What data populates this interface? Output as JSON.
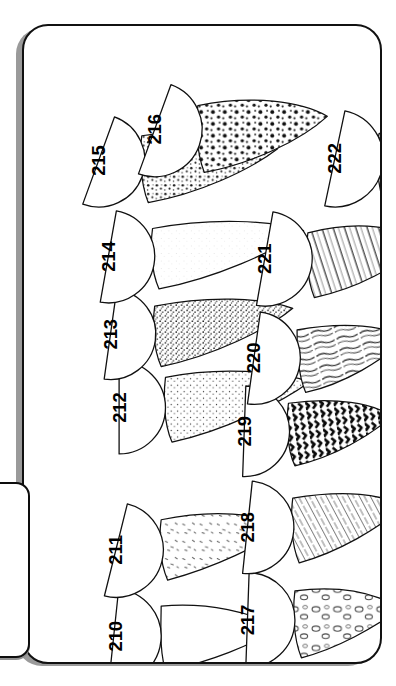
{
  "plate": {
    "tab_label": "Planche 15A",
    "title": "Planche 15A",
    "kind": "mycological identification plate",
    "orientation": "rotated-90",
    "background_color": "#ffffff",
    "ink_color": "#111111",
    "frame_shadow_color": "#9a9a9a"
  },
  "figures": [
    {
      "id": "fig-210",
      "number": "210",
      "cap_texture": "smooth",
      "stem_texture": "smooth",
      "cap": {
        "cx": 98,
        "cy": 588,
        "r": 44,
        "rot": 96
      },
      "num": {
        "x": 100,
        "y": 588
      },
      "stem": "M 142 560 C 186 556 226 566 252 580 C 226 596 188 612 146 620 C 140 600 142 576 142 560 Z"
    },
    {
      "id": "fig-211",
      "number": "211",
      "cap_texture": "smooth",
      "stem_texture": "sparse-flecks",
      "cap": {
        "cx": 100,
        "cy": 508,
        "r": 44,
        "rot": 104
      },
      "num": {
        "x": 100,
        "y": 508
      },
      "stem": "M 142 480 C 190 470 232 474 258 486 C 234 504 192 524 148 536 C 140 518 140 494 142 480 Z"
    },
    {
      "id": "fig-212",
      "number": "212",
      "cap_texture": "smooth",
      "stem_texture": "fine-stipple",
      "cap": {
        "cx": 103,
        "cy": 376,
        "r": 43,
        "rot": 90
      },
      "num": {
        "x": 103,
        "y": 376
      },
      "stem": "M 146 348 C 196 338 248 342 280 352 C 252 372 200 398 152 408 C 144 390 144 364 146 348 Z"
    },
    {
      "id": "fig-213",
      "number": "213",
      "cap_texture": "smooth",
      "stem_texture": "dense-stipple",
      "cap": {
        "cx": 95,
        "cy": 308,
        "r": 42,
        "rot": 98
      },
      "num": {
        "x": 95,
        "y": 308
      },
      "stem": "M 136 282 C 186 272 236 274 264 284 C 240 304 190 328 142 338 C 134 320 134 296 136 282 Z"
    },
    {
      "id": "fig-214",
      "number": "214",
      "cap_texture": "smooth",
      "stem_texture": "pale-smooth",
      "cap": {
        "cx": 93,
        "cy": 236,
        "r": 43,
        "rot": 100
      },
      "num": {
        "x": 93,
        "y": 236
      },
      "stem": "M 134 210 C 188 200 244 202 274 212 C 246 232 192 256 140 266 C 132 248 132 224 134 210 Z"
    },
    {
      "id": "fig-215",
      "number": "215",
      "cap_texture": "smooth",
      "stem_texture": "coarse-stipple",
      "cap": {
        "cx": 84,
        "cy": 147,
        "r": 43,
        "rot": 110
      },
      "num": {
        "x": 84,
        "y": 147
      },
      "stem": "M 124 124 C 176 116 224 122 250 136 C 224 156 176 178 130 186 C 122 166 122 138 124 124 Z"
    },
    {
      "id": "fig-216",
      "number": "216",
      "cap_texture": "smooth",
      "stem_texture": "bold-dots",
      "cap": {
        "cx": 136,
        "cy": 118,
        "r": 44,
        "rot": 110
      },
      "num": {
        "x": 136,
        "y": 118
      },
      "stem": "M 176 96 C 226 86 272 92 296 106 C 272 128 226 150 182 158 C 174 138 174 110 176 96 Z"
    },
    {
      "id": "fig-217",
      "number": "217",
      "cap_texture": "smooth",
      "stem_texture": "scale-patches",
      "cap": {
        "cx": 222,
        "cy": 573,
        "r": 44,
        "rot": 92
      },
      "num": {
        "x": 222,
        "y": 573
      },
      "stem": "M 266 546 C 312 540 344 550 364 562 C 340 580 304 600 272 608 C 264 588 264 562 266 546 Z"
    },
    {
      "id": "fig-218",
      "number": "218",
      "cap_texture": "smooth",
      "stem_texture": "hatched-bands",
      "cap": {
        "cx": 222,
        "cy": 487,
        "r": 43,
        "rot": 96
      },
      "num": {
        "x": 222,
        "y": 487
      },
      "stem": "M 264 460 C 312 452 348 456 366 468 C 344 488 306 510 270 520 C 262 502 262 476 264 460 Z"
    },
    {
      "id": "fig-219",
      "number": "219",
      "cap_texture": "smooth",
      "stem_texture": "dark-zigzag-bands",
      "cap": {
        "cx": 219,
        "cy": 398,
        "r": 42,
        "rot": 92
      },
      "num": {
        "x": 219,
        "y": 398
      },
      "stem": "M 260 372 C 304 366 338 372 356 384 C 336 402 302 422 266 430 C 258 414 258 386 260 372 Z"
    },
    {
      "id": "fig-220",
      "number": "220",
      "cap_texture": "smooth",
      "stem_texture": "wavy-streaks",
      "cap": {
        "cx": 228,
        "cy": 330,
        "r": 43,
        "rot": 98
      },
      "num": {
        "x": 228,
        "y": 330
      },
      "stem": "M 268 304 C 314 296 350 300 368 312 C 348 332 312 354 276 362 C 268 344 268 318 268 304 Z"
    },
    {
      "id": "fig-221",
      "number": "221",
      "cap_texture": "smooth",
      "stem_texture": "long-grooved",
      "cap": {
        "cx": 238,
        "cy": 238,
        "r": 44,
        "rot": 100
      },
      "num": {
        "x": 238,
        "y": 238
      },
      "stem": "M 278 214 C 326 202 364 208 380 224 C 362 246 322 266 284 274 C 276 254 276 228 278 214 Z"
    },
    {
      "id": "fig-222",
      "number": "222",
      "cap_texture": "smooth",
      "stem_texture": "fibrous-striate",
      "cap": {
        "cx": 303,
        "cy": 145,
        "r": 45,
        "rot": 102
      },
      "num": {
        "x": 303,
        "y": 145
      },
      "stem": "M 344 122 C 376 110 396 110 404 120 C 398 146 376 178 352 196 C 342 174 340 140 344 122 Z"
    }
  ],
  "legend": {
    "number_range": "210-222",
    "count": 13
  }
}
